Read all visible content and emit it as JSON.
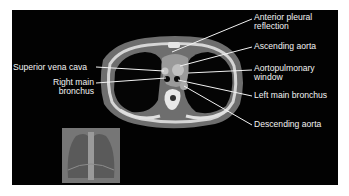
{
  "figure": {
    "type": "CT chest axial slice with labeled anatomy",
    "background_color": "#020202",
    "label_color": "#f2f2f2",
    "labels": {
      "anterior_pleural_reflection": [
        "Anterior pleural",
        "reflection"
      ],
      "ascending_aorta": "Ascending aorta",
      "superior_vena_cava": "Superior vena cava",
      "aortopulmonary_window": [
        "Aortopulmonary",
        "window"
      ],
      "right_main_bronchus": [
        "Right main",
        "bronchus"
      ],
      "left_main_bronchus": "Left main bronchus",
      "descending_aorta": "Descending aorta"
    },
    "inset": "Scout chest radiograph thumbnail"
  }
}
